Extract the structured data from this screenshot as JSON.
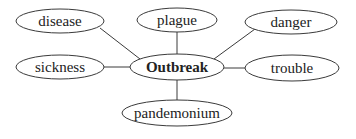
{
  "diagram": {
    "type": "word-web",
    "center": {
      "id": "outbreak",
      "label": "Outbreak",
      "cx": 177,
      "cy": 67,
      "rx": 47,
      "ry": 13,
      "bold": true
    },
    "nodes": [
      {
        "id": "disease",
        "label": "disease",
        "cx": 60,
        "cy": 21,
        "rx": 44,
        "ry": 12
      },
      {
        "id": "plague",
        "label": "plague",
        "cx": 177,
        "cy": 20,
        "rx": 40,
        "ry": 12
      },
      {
        "id": "danger",
        "label": "danger",
        "cx": 291,
        "cy": 22,
        "rx": 46,
        "ry": 12
      },
      {
        "id": "sickness",
        "label": "sickness",
        "cx": 60,
        "cy": 67,
        "rx": 44,
        "ry": 12
      },
      {
        "id": "trouble",
        "label": "trouble",
        "cx": 292,
        "cy": 68,
        "rx": 47,
        "ry": 13
      },
      {
        "id": "pandemonium",
        "label": "pandemonium",
        "cx": 177,
        "cy": 113,
        "rx": 55,
        "ry": 13
      }
    ],
    "edges": [
      {
        "from": "outbreak",
        "to": "disease",
        "x1": 140,
        "y1": 59,
        "x2": 100,
        "y2": 28
      },
      {
        "from": "outbreak",
        "to": "plague",
        "x1": 177,
        "y1": 54,
        "x2": 177,
        "y2": 32
      },
      {
        "from": "outbreak",
        "to": "danger",
        "x1": 214,
        "y1": 59,
        "x2": 255,
        "y2": 29
      },
      {
        "from": "outbreak",
        "to": "sickness",
        "x1": 130,
        "y1": 67,
        "x2": 104,
        "y2": 67
      },
      {
        "from": "outbreak",
        "to": "trouble",
        "x1": 224,
        "y1": 68,
        "x2": 245,
        "y2": 68
      },
      {
        "from": "outbreak",
        "to": "pandemonium",
        "x1": 177,
        "y1": 80,
        "x2": 177,
        "y2": 100
      }
    ],
    "colors": {
      "stroke": "#3a3a3a",
      "text": "#222222",
      "fill": "#ffffff",
      "background": "#ffffff"
    }
  }
}
